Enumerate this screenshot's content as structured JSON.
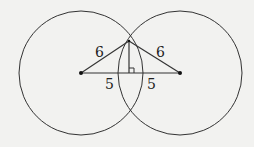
{
  "diagram": {
    "type": "two intersecting circles with triangle",
    "colors": {
      "background": "#f2f2f0",
      "stroke": "#333333"
    },
    "circles": [
      {
        "name": "left-circle",
        "cx": 81,
        "cy": 73,
        "r": 62
      },
      {
        "name": "right-circle",
        "cx": 180,
        "cy": 73,
        "r": 62
      }
    ],
    "labels": {
      "left_radius": "6",
      "right_radius": "6",
      "left_half_base": "5",
      "right_half_base": "5"
    }
  }
}
